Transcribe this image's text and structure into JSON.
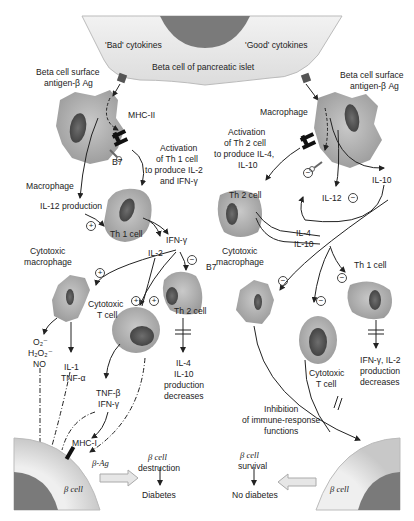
{
  "top_cell": {
    "label": "Beta cell of pancreatic islet",
    "bad_cytokines": "'Bad' cytokines",
    "good_cytokines": "'Good' cytokines"
  },
  "left_pathway": {
    "antigen_label_1": "Beta cell surface",
    "antigen_label_2": "antigen-β Ag",
    "mhc2": "MHC-II",
    "b7": "B7",
    "macrophage": "Macrophage",
    "activation_1": "Activation",
    "activation_2": "of Th 1 cell",
    "activation_3": "to produce IL-2",
    "activation_4": "and IFN-γ",
    "il12_production": "IL-12 production",
    "th1_cell": "Th 1 cell",
    "ifn_gamma": "IFN-γ",
    "il2": "IL-2",
    "cytotoxic_macrophage_1": "Cytotoxic",
    "cytotoxic_macrophage_2": "macrophage",
    "cytotoxic_t_1": "Cytotoxic",
    "cytotoxic_t_2": "T cell",
    "th2_cell": "Th 2 cell",
    "radicals_1": "O₂⁻",
    "radicals_2": "H₂O₂⁻",
    "radicals_3": "NO",
    "il1_1": "IL-1",
    "il1_2": "TNF-α",
    "tnf_1": "TNF-β",
    "tnf_2": "IFN-γ",
    "il4_dec_1": "IL-4",
    "il4_dec_2": "IL-10",
    "il4_dec_3": "production",
    "il4_dec_4": "decreases",
    "mhc1": "MHC-I",
    "beta_ag": "β-Ag",
    "beta_cell": "β cell",
    "outcome_1": "β cell",
    "outcome_2": "destruction",
    "outcome_3": "Diabetes",
    "plus": "+",
    "minus": "−"
  },
  "right_pathway": {
    "antigen_label_1": "Beta cell surface",
    "antigen_label_2": "antigen-β Ag",
    "macrophage": "Macrophage",
    "activation_1": "Activation",
    "activation_2": "of Th 2 cell",
    "activation_3": "to produce IL-4,",
    "activation_4": "IL-10",
    "il10": "IL-10",
    "il12": "IL-12",
    "th2_cell": "Th 2 cell",
    "il4": "IL-4",
    "il10b": "IL-10",
    "cytotoxic_macrophage_1": "Cytotoxic",
    "cytotoxic_macrophage_2": "macrophage",
    "b7": "B7",
    "th1_cell": "Th 1 cell",
    "cytotoxic_t_1": "Cytotoxic",
    "cytotoxic_t_2": "T cell",
    "ifn_dec_1": "IFN-γ, IL-2",
    "ifn_dec_2": "production",
    "ifn_dec_3": "decreases",
    "inhibition_1": "Inhibition",
    "inhibition_2": "of immune-response",
    "inhibition_3": "functions",
    "beta_cell": "β cell",
    "outcome_1": "β cell",
    "outcome_2": "survival",
    "outcome_3": "No diabetes",
    "minus": "−"
  }
}
